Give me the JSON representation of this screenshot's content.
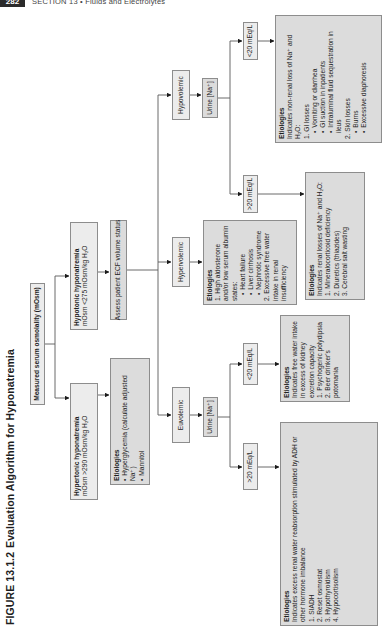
{
  "header": {
    "page_number": "282",
    "running_head": "SECTION 13 • Fluids and Electrolytes"
  },
  "figure": {
    "label": "FIGURE 13.1.2",
    "title": "Evaluation Algorithm for Hyponatremia",
    "root": "Measured serum osmolality (mOsm)",
    "hypertonic": {
      "title": "Hypertonic hyponatremia",
      "criterion": "mOsm >290 mOsm/kg H₂O",
      "etiologies": {
        "heading": "Etiologies",
        "items": [
          "Hyperglycemia (calculate adjusted Na⁺)",
          "Mannitol"
        ]
      }
    },
    "hypotonic": {
      "title": "Hypotonic hyponatremia",
      "criterion": "mOsm <275 mOsm/kg H₂O",
      "next_step": "Assess patient ECF volume status"
    },
    "euvolemic": {
      "label": "Euvolemic",
      "test": "Urine [Na⁺]",
      "high": {
        "label": ">20 mEq/L",
        "heading": "Etiologies",
        "description": "Indicates excess renal water reabsorption stimulated by ADH or other hormone imbalance",
        "items": [
          "1. SIADH",
          "2. Reset osmostat",
          "3. Hypothyroidism",
          "4. Hypocortisolism"
        ]
      },
      "low": {
        "label": "<20 mEq/L",
        "heading": "Etiologies",
        "description": "Indicates free water intake in excess of kidney excretion capacity",
        "items": [
          "1. Psychogenic polydipsia",
          "2. Beer drinker's potomania"
        ]
      }
    },
    "hypervolemic": {
      "label": "Hypervolemic",
      "heading": "Etiologies",
      "item1": "1. High aldosterone and/or low serum albumin states:",
      "subitems": [
        "Heart failure",
        "Liver cirrhosis",
        "Nephrotic syndrome"
      ],
      "item2": "2. Excessive free water intake in renal insufficiency"
    },
    "hypovolemic": {
      "label": "Hypovolemic",
      "test": "Urine [Na⁺]",
      "high": {
        "label": ">20 mEq/L",
        "heading": "Etiologies",
        "description": "Indicates renal losses of Na⁺ and H₂O:",
        "items": [
          "1. Mineralocorticoid deficiency",
          "2. Diuretics (thiazides)",
          "3. Cerebral salt wasting"
        ]
      },
      "low": {
        "label": "<20 mEq/L",
        "heading": "Etiologies",
        "description": "Indicates non-renal loss of Na⁺ and H₂O:",
        "group1": "1. GI losses",
        "group1_items": [
          "Vomiting or diarrhea",
          "GI suction in inpatients",
          "Intraluminal fluid sequestration in ileus"
        ],
        "group2": "2. Skin losses",
        "group2_items": [
          "Burns",
          "Excessive diaphoresis"
        ]
      }
    }
  }
}
